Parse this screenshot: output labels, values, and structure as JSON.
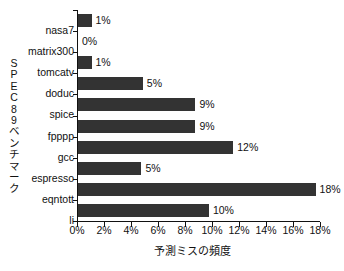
{
  "chart_data": {
    "type": "bar",
    "orientation": "horizontal",
    "title": "",
    "xlabel": "予測ミスの頻度",
    "ylabel": "SPEC89ベンチマーク",
    "categories": [
      "nasa7",
      "matrix300",
      "tomcatv",
      "doduc",
      "spice",
      "fpppp",
      "gcc",
      "espresso",
      "eqntott",
      "li"
    ],
    "values": [
      1,
      0,
      1,
      5,
      9,
      9,
      12,
      5,
      18,
      10
    ],
    "bar_lengths_pct": [
      1.0,
      0.0,
      1.0,
      4.8,
      8.7,
      8.7,
      11.5,
      4.7,
      17.6,
      9.7
    ],
    "data_labels": [
      "1%",
      "0%",
      "1%",
      "5%",
      "9%",
      "9%",
      "12%",
      "5%",
      "18%",
      "10%"
    ],
    "xlim": [
      0,
      18
    ],
    "xticks": [
      0,
      2,
      4,
      6,
      8,
      10,
      12,
      14,
      16,
      18
    ],
    "xtick_labels": [
      "0%",
      "2%",
      "4%",
      "6%",
      "8%",
      "10%",
      "12%",
      "14%",
      "16%",
      "18%"
    ],
    "grid": false,
    "legend": null,
    "bar_color": "#333333",
    "axis_color": "#111111",
    "background": "#ffffff"
  },
  "y_axis_title_chars": [
    "S",
    "P",
    "E",
    "C",
    "8",
    "9",
    "ベ",
    "ン",
    "チ",
    "マ",
    "ー",
    "ク"
  ]
}
